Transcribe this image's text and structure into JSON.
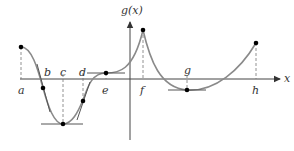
{
  "diagram": {
    "axes": {
      "y_label": "g(x)",
      "x_label": "x"
    },
    "points": [
      {
        "label": "a",
        "desc": "left endpoint, local max"
      },
      {
        "label": "b",
        "desc": "inflection point with tangent"
      },
      {
        "label": "c",
        "desc": "local minimum, horizontal tangent"
      },
      {
        "label": "d",
        "desc": "inflection point with tangent"
      },
      {
        "label": "e",
        "desc": "horizontal tangent inflection"
      },
      {
        "label": "f",
        "desc": "cusp, local maximum"
      },
      {
        "label": "g",
        "desc": "local minimum, horizontal tangent"
      },
      {
        "label": "h",
        "desc": "right endpoint"
      }
    ],
    "colors": {
      "curve": "#8a8a8a",
      "axis": "#333333",
      "tangent": "#555555",
      "point": "#000000",
      "dashed": "#777777"
    }
  }
}
